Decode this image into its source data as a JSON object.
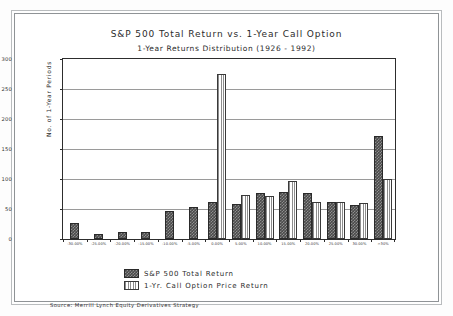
{
  "figure": {
    "title": "S&P 500 Total Return vs. 1-Year Call Option",
    "subtitle": "1-Year Returns Distribution (1926 - 1992)",
    "source": "Source:  Merrill Lynch Equity Derivatives Strategy"
  },
  "legend": {
    "items": [
      {
        "label": "S&P 500 Total Return",
        "swatch": "dark-checkered-swatch",
        "color": "#4a4a4a"
      },
      {
        "label": "1-Yr. Call Option Price Return",
        "swatch": "light-striped-swatch",
        "color": "#e8e8e8"
      }
    ]
  },
  "chart_data": {
    "type": "bar",
    "title": "S&P 500 Total Return vs. 1-Year Call Option",
    "subtitle": "1-Year Returns Distribution (1926 - 1992)",
    "xlabel": "",
    "ylabel": "No. of 1-Year Periods",
    "ylim": [
      0,
      300
    ],
    "yticks": [
      0,
      50,
      100,
      150,
      200,
      250,
      300
    ],
    "grid": true,
    "legend_position": "below-axes-left",
    "categories": [
      "-30.00%",
      "-25.00%",
      "-20.00%",
      "-15.00%",
      "-10.00%",
      "-5.00%",
      "0.00%",
      "5.00%",
      "10.00%",
      "15.00%",
      "20.00%",
      "25.00%",
      "30.00%",
      ">30%"
    ],
    "series": [
      {
        "name": "S&P 500 Total Return",
        "values": [
          26,
          9,
          12,
          11,
          47,
          53,
          61,
          59,
          77,
          79,
          77,
          62,
          56,
          171
        ]
      },
      {
        "name": "1-Yr. Call Option Price Return",
        "values": [
          0,
          0,
          0,
          0,
          0,
          0,
          275,
          74,
          72,
          96,
          61,
          61,
          60,
          100
        ]
      }
    ]
  }
}
